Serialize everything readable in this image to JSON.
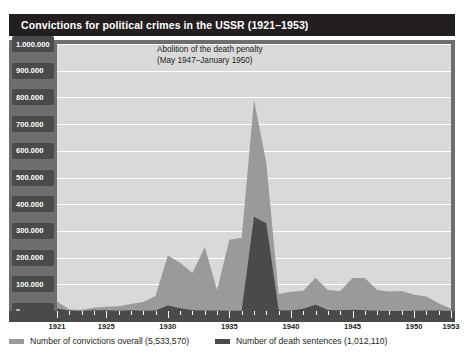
{
  "title": "Convictions for political crimes in the USSR (1921–1953)",
  "annotation": {
    "line1": "Abolition of the death penalty",
    "line2": "(May 1947–January 1950)"
  },
  "legend": [
    {
      "label": "Number of convictions overall (5,533,570)",
      "color": "#9a9a9a",
      "name": "convictions-overall"
    },
    {
      "label": "Number of death sentences (1,012,110)",
      "color": "#4a4a4a",
      "name": "death-sentences"
    }
  ],
  "colors": {
    "title_bar": "#231f20",
    "frame": "#6e6e6e",
    "plot_background": "#d9d9d9",
    "gridline": "#ffffff",
    "axis_block": "#4a4a4a",
    "series_overall": "#9a9a9a",
    "series_death": "#4a4a4a"
  },
  "y_axis": {
    "labels": [
      "1.000.000",
      "900.000",
      "800.000",
      "700.000",
      "600.000",
      "500.000",
      "400.000",
      "300.000",
      "200.000",
      "100.000",
      "0"
    ],
    "min": 0,
    "max": 1000000,
    "step": 100000
  },
  "x_axis": {
    "labels": [
      "1921",
      "1925",
      "1930",
      "1935",
      "1940",
      "1945",
      "1950",
      "1953"
    ],
    "min": 1921,
    "max": 1953
  },
  "chart_data": {
    "type": "area",
    "title": "Convictions for political crimes in the USSR (1921–1953)",
    "xlabel": "",
    "ylabel": "",
    "xlim": [
      1921,
      1953
    ],
    "ylim": [
      0,
      1000000
    ],
    "grid": true,
    "legend_position": "bottom",
    "x": [
      1921,
      1922,
      1923,
      1924,
      1925,
      1926,
      1927,
      1928,
      1929,
      1930,
      1931,
      1932,
      1933,
      1934,
      1935,
      1936,
      1937,
      1938,
      1939,
      1940,
      1941,
      1942,
      1943,
      1944,
      1945,
      1946,
      1947,
      1948,
      1949,
      1950,
      1951,
      1952,
      1953
    ],
    "series": [
      {
        "name": "Number of convictions overall (5,533,570)",
        "color": "#9a9a9a",
        "total": 5533570,
        "values": [
          35829,
          6003,
          4794,
          12425,
          15995,
          17804,
          26036,
          33757,
          56220,
          208069,
          180696,
          141919,
          239664,
          78999,
          267076,
          274670,
          790665,
          554258,
          63889,
          71806,
          75411,
          124406,
          78441,
          75109,
          123248,
          123294,
          78810,
          73269,
          75125,
          60641,
          54775,
          28800,
          8403
        ]
      },
      {
        "name": "Number of death sentences (1,012,110)",
        "color": "#4a4a4a",
        "total": 1012110,
        "values": [
          9701,
          1962,
          414,
          2550,
          2433,
          990,
          2363,
          869,
          2109,
          20201,
          10651,
          2728,
          2154,
          2056,
          1229,
          1118,
          353074,
          328618,
          2552,
          1649,
          8011,
          23278,
          3579,
          3029,
          4252,
          2896,
          1105,
          0,
          0,
          475,
          1609,
          1612,
          198
        ]
      }
    ],
    "annotations": [
      {
        "text": "Abolition of the death penalty (May 1947–January 1950)",
        "x": 1947.5,
        "y": 260000
      }
    ]
  }
}
